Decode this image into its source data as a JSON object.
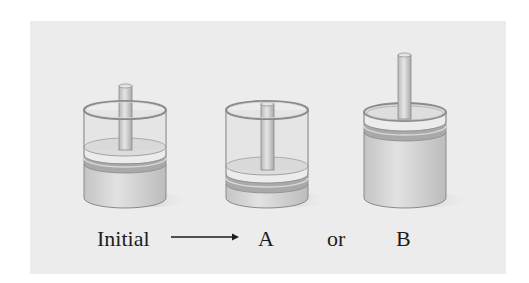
{
  "figure": {
    "background": "#ececec",
    "labels": {
      "initial": "Initial",
      "a": "A",
      "or": "or",
      "b": "B"
    },
    "arrow": "long-right-arrow",
    "cylinders": [
      {
        "id": "initial",
        "state": "piston-middle",
        "label": "Initial"
      },
      {
        "id": "a",
        "state": "piston-low (compressed)",
        "label": "A"
      },
      {
        "id": "b",
        "state": "piston-top (expanded)",
        "label": "B"
      }
    ]
  }
}
